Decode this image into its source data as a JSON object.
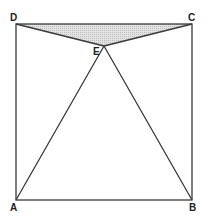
{
  "diagram": {
    "title": "",
    "colors": {
      "stroke": "#3a3a3a",
      "shade": "#d6d6d6",
      "label": "#222222"
    },
    "points": {
      "A": {
        "label": "A",
        "x": 16,
        "y": 200
      },
      "B": {
        "label": "B",
        "x": 192,
        "y": 200
      },
      "C": {
        "label": "C",
        "x": 192,
        "y": 24
      },
      "D": {
        "label": "D",
        "x": 16,
        "y": 24
      },
      "E": {
        "label": "E",
        "x": 104,
        "y": 46
      }
    },
    "square": "ABCD",
    "shaded_triangle": "DEC",
    "segments": [
      "AB",
      "BC",
      "CD",
      "DA",
      "AE",
      "BE",
      "DE",
      "CE"
    ]
  }
}
